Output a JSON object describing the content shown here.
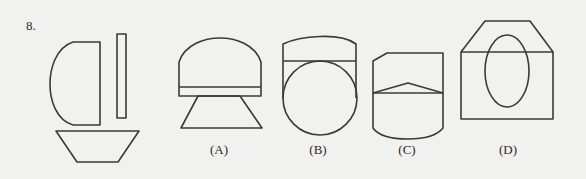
{
  "question": {
    "number": "8."
  },
  "figures": {
    "given": {
      "parts": [
        "d-shape",
        "thin-rectangle",
        "inverted-trapezoid"
      ]
    },
    "options": [
      {
        "id": "A",
        "label": "(A)",
        "x": 219
      },
      {
        "id": "B",
        "label": "(B)",
        "x": 318
      },
      {
        "id": "C",
        "label": "(C)",
        "x": 407
      },
      {
        "id": "D",
        "label": "(D)",
        "x": 508
      }
    ]
  },
  "colors": {
    "background": "#f1f1ef",
    "line": "#3a3a3a"
  }
}
